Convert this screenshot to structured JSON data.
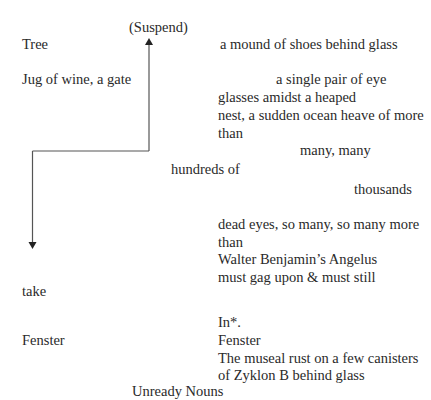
{
  "poem": {
    "title": "Unready Nouns",
    "suspend": "(Suspend)",
    "left": {
      "tree": "Tree",
      "jug": "Jug of wine, a gate",
      "take": "take",
      "fenster": "Fenster"
    },
    "right": {
      "l1": "a mound of shoes behind glass",
      "l2": "a single pair of eye",
      "l3": "glasses amidst a heaped",
      "l4": "nest, a sudden ocean heave of more",
      "l5": "than",
      "l6": "many, many",
      "l7": "hundreds of",
      "l8": "thousands",
      "l9": "dead eyes, so many, so many more",
      "l10": "than",
      "l11": "Walter Benjamin’s Angelus",
      "l12": "must gag upon & must still",
      "l13": "In*.",
      "l14": "Fenster",
      "l15": "The museal rust on a few canisters",
      "l16": "of Zyklon B behind glass"
    },
    "arrows": {
      "color": "#555555"
    }
  }
}
